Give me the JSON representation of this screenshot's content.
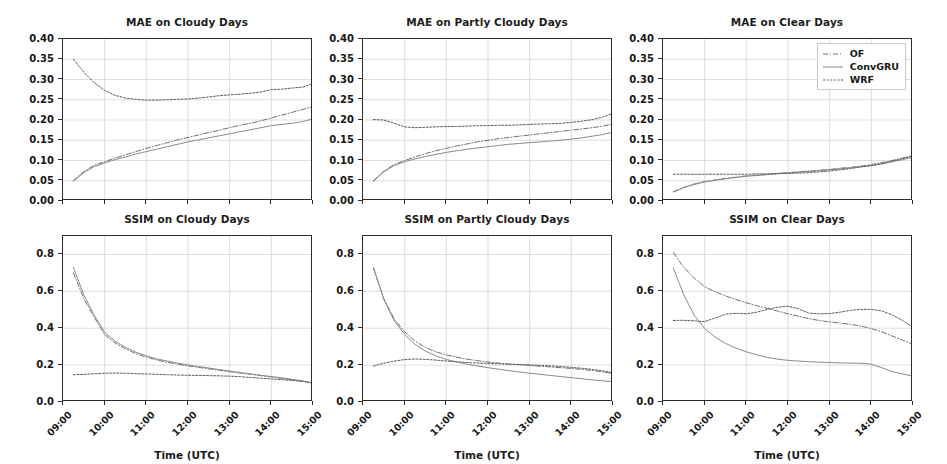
{
  "figure": {
    "xlabel": "Time (UTC)",
    "xtick_labels": [
      "09:00",
      "10:00",
      "11:00",
      "12:00",
      "13:00",
      "14:00",
      "15:00"
    ],
    "mae_ytick_labels": [
      "0.00",
      "0.05",
      "0.10",
      "0.15",
      "0.20",
      "0.25",
      "0.30",
      "0.35",
      "0.40"
    ],
    "ssim_ytick_labels": [
      "0.0",
      "0.2",
      "0.4",
      "0.6",
      "0.8"
    ],
    "legend": {
      "entries": [
        {
          "label": "OF",
          "style": "dashdot",
          "color": "#6f6f6f"
        },
        {
          "label": "ConvGRU",
          "style": "solid",
          "color": "#8a8a8a"
        },
        {
          "label": "WRF",
          "style": "dotted",
          "color": "#5c5c5c"
        }
      ]
    },
    "colors": {
      "axis": "#2b2b2b",
      "grid": "#cfcfcf",
      "background": "#ffffff",
      "text": "#161616"
    }
  },
  "chart_data": [
    {
      "type": "line",
      "title": "MAE on Cloudy Days",
      "xlabel": "",
      "ylabel": "",
      "ylim": [
        0.0,
        0.4
      ],
      "xlim": [
        9.0,
        15.0
      ],
      "grid": true,
      "legend_position": "none",
      "x": [
        9.25,
        9.5,
        9.75,
        10.0,
        10.25,
        10.5,
        10.75,
        11.0,
        11.25,
        11.5,
        11.75,
        12.0,
        12.25,
        12.5,
        12.75,
        13.0,
        13.25,
        13.5,
        13.75,
        14.0,
        14.25,
        14.5,
        14.75,
        15.0
      ],
      "series": [
        {
          "name": "OF",
          "style": "dashdot",
          "values": [
            0.05,
            0.073,
            0.088,
            0.097,
            0.106,
            0.114,
            0.122,
            0.13,
            0.137,
            0.144,
            0.151,
            0.157,
            0.163,
            0.169,
            0.175,
            0.181,
            0.187,
            0.192,
            0.198,
            0.205,
            0.212,
            0.219,
            0.226,
            0.233
          ]
        },
        {
          "name": "ConvGRU",
          "style": "solid",
          "values": [
            0.049,
            0.07,
            0.085,
            0.094,
            0.102,
            0.109,
            0.116,
            0.122,
            0.128,
            0.134,
            0.14,
            0.146,
            0.151,
            0.156,
            0.161,
            0.166,
            0.171,
            0.176,
            0.181,
            0.186,
            0.189,
            0.192,
            0.196,
            0.203
          ]
        },
        {
          "name": "WRF",
          "style": "dotted",
          "values": [
            0.35,
            0.318,
            0.292,
            0.273,
            0.261,
            0.254,
            0.251,
            0.249,
            0.249,
            0.25,
            0.251,
            0.252,
            0.254,
            0.257,
            0.26,
            0.262,
            0.264,
            0.266,
            0.269,
            0.275,
            0.276,
            0.279,
            0.281,
            0.29
          ]
        }
      ]
    },
    {
      "type": "line",
      "title": "MAE on Partly Cloudy Days",
      "xlabel": "",
      "ylabel": "",
      "ylim": [
        0.0,
        0.4
      ],
      "xlim": [
        9.0,
        15.0
      ],
      "grid": true,
      "legend_position": "none",
      "x": [
        9.25,
        9.5,
        9.75,
        10.0,
        10.25,
        10.5,
        10.75,
        11.0,
        11.25,
        11.5,
        11.75,
        12.0,
        12.25,
        12.5,
        12.75,
        13.0,
        13.25,
        13.5,
        13.75,
        14.0,
        14.25,
        14.5,
        14.75,
        15.0
      ],
      "series": [
        {
          "name": "OF",
          "style": "dashdot",
          "values": [
            0.05,
            0.074,
            0.09,
            0.1,
            0.109,
            0.117,
            0.124,
            0.13,
            0.136,
            0.141,
            0.146,
            0.15,
            0.154,
            0.157,
            0.16,
            0.163,
            0.166,
            0.169,
            0.172,
            0.175,
            0.178,
            0.181,
            0.185,
            0.19
          ]
        },
        {
          "name": "ConvGRU",
          "style": "solid",
          "values": [
            0.049,
            0.072,
            0.088,
            0.097,
            0.104,
            0.11,
            0.115,
            0.12,
            0.124,
            0.128,
            0.131,
            0.134,
            0.137,
            0.14,
            0.142,
            0.144,
            0.146,
            0.148,
            0.15,
            0.153,
            0.156,
            0.16,
            0.164,
            0.17
          ]
        },
        {
          "name": "WRF",
          "style": "dotted",
          "values": [
            0.201,
            0.2,
            0.192,
            0.183,
            0.181,
            0.182,
            0.183,
            0.184,
            0.184,
            0.185,
            0.186,
            0.186,
            0.187,
            0.187,
            0.188,
            0.189,
            0.19,
            0.191,
            0.192,
            0.194,
            0.197,
            0.201,
            0.207,
            0.217
          ]
        }
      ]
    },
    {
      "type": "line",
      "title": "MAE on Clear Days",
      "xlabel": "",
      "ylabel": "",
      "ylim": [
        0.0,
        0.4
      ],
      "xlim": [
        9.0,
        15.0
      ],
      "grid": true,
      "legend_position": "upper right",
      "x": [
        9.25,
        9.5,
        9.75,
        10.0,
        10.25,
        10.5,
        10.75,
        11.0,
        11.25,
        11.5,
        11.75,
        12.0,
        12.25,
        12.5,
        12.75,
        13.0,
        13.25,
        13.5,
        13.75,
        14.0,
        14.25,
        14.5,
        14.75,
        15.0
      ],
      "series": [
        {
          "name": "OF",
          "style": "dashdot",
          "values": [
            0.023,
            0.034,
            0.042,
            0.048,
            0.052,
            0.056,
            0.059,
            0.062,
            0.064,
            0.066,
            0.068,
            0.07,
            0.072,
            0.074,
            0.076,
            0.078,
            0.081,
            0.083,
            0.086,
            0.09,
            0.095,
            0.1,
            0.106,
            0.112
          ]
        },
        {
          "name": "ConvGRU",
          "style": "solid",
          "values": [
            0.022,
            0.033,
            0.041,
            0.047,
            0.051,
            0.055,
            0.058,
            0.061,
            0.063,
            0.065,
            0.067,
            0.069,
            0.071,
            0.073,
            0.075,
            0.077,
            0.079,
            0.082,
            0.085,
            0.088,
            0.092,
            0.097,
            0.102,
            0.108
          ]
        },
        {
          "name": "WRF",
          "style": "dotted",
          "values": [
            0.066,
            0.066,
            0.066,
            0.066,
            0.066,
            0.066,
            0.066,
            0.066,
            0.067,
            0.067,
            0.068,
            0.068,
            0.069,
            0.07,
            0.072,
            0.074,
            0.077,
            0.08,
            0.084,
            0.087,
            0.092,
            0.098,
            0.105,
            0.111
          ]
        }
      ]
    },
    {
      "type": "line",
      "title": "SSIM on Cloudy Days",
      "xlabel": "Time (UTC)",
      "ylabel": "",
      "ylim": [
        0.0,
        0.9
      ],
      "xlim": [
        9.0,
        15.0
      ],
      "grid": true,
      "legend_position": "none",
      "x": [
        9.25,
        9.5,
        9.75,
        10.0,
        10.25,
        10.5,
        10.75,
        11.0,
        11.25,
        11.5,
        11.75,
        12.0,
        12.25,
        12.5,
        12.75,
        13.0,
        13.25,
        13.5,
        13.75,
        14.0,
        14.25,
        14.5,
        14.75,
        15.0
      ],
      "series": [
        {
          "name": "OF",
          "style": "dashdot",
          "values": [
            0.7,
            0.56,
            0.46,
            0.365,
            0.32,
            0.288,
            0.262,
            0.243,
            0.228,
            0.215,
            0.205,
            0.196,
            0.188,
            0.18,
            0.172,
            0.164,
            0.157,
            0.15,
            0.143,
            0.136,
            0.128,
            0.12,
            0.112,
            0.103
          ]
        },
        {
          "name": "ConvGRU",
          "style": "solid",
          "values": [
            0.73,
            0.58,
            0.47,
            0.378,
            0.33,
            0.296,
            0.27,
            0.25,
            0.234,
            0.222,
            0.211,
            0.201,
            0.192,
            0.184,
            0.176,
            0.168,
            0.16,
            0.152,
            0.145,
            0.138,
            0.131,
            0.123,
            0.114,
            0.101
          ]
        },
        {
          "name": "WRF",
          "style": "dotted",
          "values": [
            0.148,
            0.15,
            0.153,
            0.156,
            0.157,
            0.156,
            0.154,
            0.152,
            0.15,
            0.148,
            0.146,
            0.145,
            0.144,
            0.143,
            0.142,
            0.14,
            0.137,
            0.133,
            0.129,
            0.125,
            0.121,
            0.117,
            0.112,
            0.104
          ]
        }
      ]
    },
    {
      "type": "line",
      "title": "SSIM on Partly Cloudy Days",
      "xlabel": "Time (UTC)",
      "ylabel": "",
      "ylim": [
        0.0,
        0.9
      ],
      "xlim": [
        9.0,
        15.0
      ],
      "grid": true,
      "legend_position": "none",
      "x": [
        9.25,
        9.5,
        9.75,
        10.0,
        10.25,
        10.5,
        10.75,
        11.0,
        11.25,
        11.5,
        11.75,
        12.0,
        12.25,
        12.5,
        12.75,
        13.0,
        13.25,
        13.5,
        13.75,
        14.0,
        14.25,
        14.5,
        14.75,
        15.0
      ],
      "series": [
        {
          "name": "OF",
          "style": "dashdot",
          "values": [
            0.725,
            0.56,
            0.45,
            0.38,
            0.33,
            0.296,
            0.272,
            0.255,
            0.243,
            0.232,
            0.224,
            0.217,
            0.211,
            0.206,
            0.202,
            0.198,
            0.194,
            0.19,
            0.186,
            0.182,
            0.177,
            0.171,
            0.164,
            0.155
          ]
        },
        {
          "name": "ConvGRU",
          "style": "solid",
          "values": [
            0.73,
            0.555,
            0.44,
            0.366,
            0.312,
            0.276,
            0.25,
            0.231,
            0.217,
            0.205,
            0.195,
            0.186,
            0.178,
            0.17,
            0.163,
            0.156,
            0.15,
            0.144,
            0.138,
            0.132,
            0.126,
            0.12,
            0.115,
            0.11
          ]
        },
        {
          "name": "WRF",
          "style": "dotted",
          "values": [
            0.195,
            0.21,
            0.222,
            0.23,
            0.233,
            0.231,
            0.227,
            0.222,
            0.218,
            0.214,
            0.211,
            0.209,
            0.207,
            0.205,
            0.203,
            0.201,
            0.199,
            0.196,
            0.192,
            0.188,
            0.183,
            0.177,
            0.169,
            0.158
          ]
        }
      ]
    },
    {
      "type": "line",
      "title": "SSIM on Clear Days",
      "xlabel": "Time (UTC)",
      "ylabel": "",
      "ylim": [
        0.0,
        0.9
      ],
      "xlim": [
        9.0,
        15.0
      ],
      "grid": true,
      "legend_position": "none",
      "x": [
        9.25,
        9.5,
        9.75,
        10.0,
        10.25,
        10.5,
        10.75,
        11.0,
        11.25,
        11.5,
        11.75,
        12.0,
        12.25,
        12.5,
        12.75,
        13.0,
        13.25,
        13.5,
        13.75,
        14.0,
        14.25,
        14.5,
        14.75,
        15.0
      ],
      "series": [
        {
          "name": "OF",
          "style": "dashdot",
          "values": [
            0.81,
            0.73,
            0.672,
            0.625,
            0.598,
            0.575,
            0.555,
            0.538,
            0.522,
            0.508,
            0.493,
            0.478,
            0.465,
            0.452,
            0.442,
            0.434,
            0.428,
            0.421,
            0.412,
            0.398,
            0.38,
            0.358,
            0.336,
            0.312
          ]
        },
        {
          "name": "ConvGRU",
          "style": "solid",
          "values": [
            0.725,
            0.58,
            0.47,
            0.398,
            0.352,
            0.318,
            0.292,
            0.272,
            0.256,
            0.242,
            0.232,
            0.226,
            0.222,
            0.219,
            0.216,
            0.214,
            0.212,
            0.211,
            0.21,
            0.205,
            0.186,
            0.165,
            0.152,
            0.14
          ]
        },
        {
          "name": "WRF",
          "style": "dotted",
          "values": [
            0.442,
            0.443,
            0.44,
            0.436,
            0.455,
            0.476,
            0.481,
            0.478,
            0.487,
            0.502,
            0.514,
            0.519,
            0.505,
            0.482,
            0.478,
            0.48,
            0.487,
            0.497,
            0.502,
            0.502,
            0.494,
            0.472,
            0.442,
            0.404
          ]
        }
      ]
    }
  ]
}
